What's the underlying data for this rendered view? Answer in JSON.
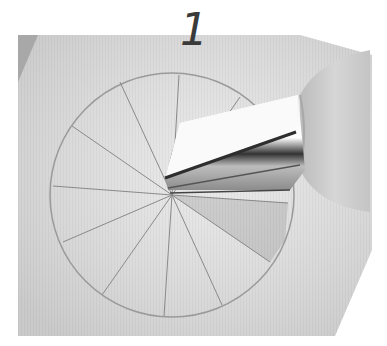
{
  "step": {
    "number": "1"
  },
  "photo": {
    "description": "Grayscale photo of a metal piping tip resting at the center of a circle drawn on paper, divided into wedge segments",
    "colors": {
      "paper": "#e6e6e6",
      "paper_shadow": "#cfcfcf",
      "lines": "#8a8a8a",
      "metal_highlight": "#ffffff",
      "metal_dark": "#3a3a3a",
      "coupler": "#c8c8c8"
    },
    "circle": {
      "cx": 172,
      "cy": 195,
      "r": 122,
      "segments": 14
    }
  }
}
